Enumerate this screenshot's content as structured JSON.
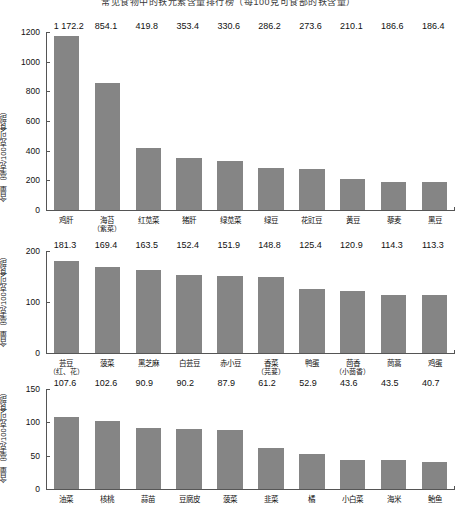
{
  "caption": {
    "text": "常见食物中的铁元素含量排行榜（每100克可食部的铁含量）"
  },
  "axis": {
    "ylabel": "含量（毫克/100克可食部）"
  },
  "chart_data": [
    {
      "type": "bar",
      "title": "",
      "xlabel": "",
      "ylabel": "含量（毫克/100克可食部）",
      "ylim": [
        0,
        1200
      ],
      "yticks": [
        "0",
        "200",
        "400",
        "600",
        "800",
        "1000",
        "1200"
      ],
      "ytick_values": [
        0,
        200,
        400,
        600,
        800,
        1000,
        1200
      ],
      "grid": false,
      "legend": "none",
      "categories": [
        "鸡肝",
        "海苔",
        "红苋菜",
        "猪肝",
        "绿苋菜",
        "绿豆",
        "花豇豆",
        "黄豆",
        "藜麦",
        "黑豆"
      ],
      "category_subs": [
        "",
        "（紫菜）",
        "",
        "",
        "",
        "",
        "",
        "",
        "",
        ""
      ],
      "values": [
        1172.2,
        854.1,
        419.8,
        353.4,
        330.6,
        286.2,
        273.6,
        210.1,
        186.6,
        186.4
      ],
      "value_labels": [
        "1 172.2",
        "854.1",
        "419.8",
        "353.4",
        "330.6",
        "286.2",
        "273.6",
        "210.1",
        "186.6",
        "186.4"
      ]
    },
    {
      "type": "bar",
      "title": "",
      "xlabel": "",
      "ylabel": "含量（毫克/100克可食部）",
      "ylim": [
        0,
        200
      ],
      "yticks": [
        "0",
        "100",
        "200"
      ],
      "ytick_values": [
        0,
        100,
        200
      ],
      "grid": false,
      "legend": "none",
      "categories": [
        "芸豆",
        "菠菜",
        "黑芝麻",
        "白芸豆",
        "赤小豆",
        "香菜",
        "鸭蛋",
        "茴香",
        "茼蒿",
        "鸡蛋"
      ],
      "category_subs": [
        "（红、花）",
        "",
        "",
        "",
        "",
        "（芫荽）",
        "",
        "（小茴香）",
        "",
        ""
      ],
      "values": [
        181.3,
        169.4,
        163.5,
        152.4,
        151.9,
        148.8,
        125.4,
        120.9,
        114.3,
        113.3
      ],
      "value_labels": [
        "181.3",
        "169.4",
        "163.5",
        "152.4",
        "151.9",
        "148.8",
        "125.4",
        "120.9",
        "114.3",
        "113.3"
      ]
    },
    {
      "type": "bar",
      "title": "",
      "xlabel": "",
      "ylabel": "含量（毫克/100克可食部）",
      "ylim": [
        0,
        150
      ],
      "yticks": [
        "0",
        "50",
        "100",
        "150"
      ],
      "ytick_values": [
        0,
        50,
        100,
        150
      ],
      "grid": false,
      "legend": "none",
      "categories": [
        "油菜",
        "核桃",
        "蒜苗",
        "豆腐皮",
        "菠菜",
        "韭菜",
        "橘",
        "小白菜",
        "海米",
        "鲐鱼"
      ],
      "category_subs": [
        "",
        "",
        "",
        "",
        "",
        "",
        "",
        "",
        "",
        ""
      ],
      "values": [
        107.6,
        102.6,
        90.9,
        90.2,
        87.9,
        61.2,
        52.9,
        43.6,
        43.5,
        40.7
      ],
      "value_labels": [
        "107.6",
        "102.6",
        "90.9",
        "90.2",
        "87.9",
        "61.2",
        "52.9",
        "43.6",
        "43.5",
        "40.7"
      ]
    }
  ],
  "colors": {
    "bar": "#858585",
    "axis": "#555555",
    "text": "#111111"
  }
}
